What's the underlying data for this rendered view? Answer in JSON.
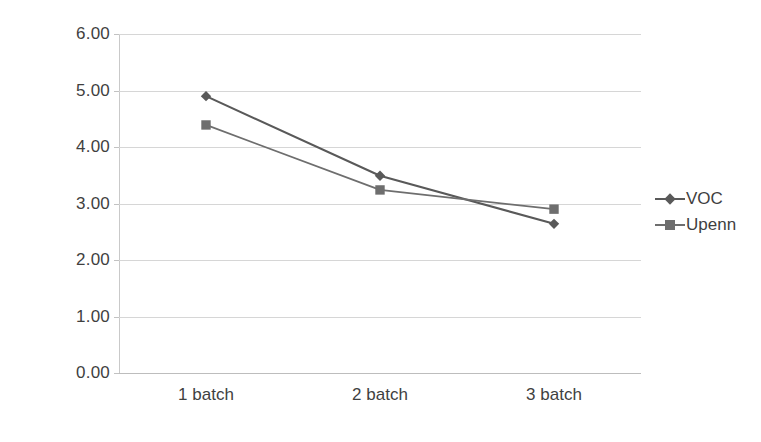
{
  "chart_data": {
    "type": "line",
    "title": "",
    "subtitle": "",
    "xlabel": "",
    "ylabel": "",
    "categories": [
      "1 batch",
      "2 batch",
      "3 batch"
    ],
    "series": [
      {
        "name": "VOC",
        "marker": "diamond",
        "color": "#595959",
        "values": [
          4.9,
          3.49,
          2.64
        ]
      },
      {
        "name": "Upenn",
        "marker": "square",
        "color": "#6e6e6e",
        "values": [
          4.39,
          3.24,
          2.9
        ]
      }
    ],
    "ylim": [
      0.0,
      6.0
    ],
    "ytick_step": 1.0,
    "ytick_labels": [
      "6.00",
      "5.00",
      "4.00",
      "3.00",
      "2.00",
      "1.00",
      "0.00"
    ],
    "ytick_values": [
      6.0,
      5.0,
      4.0,
      3.0,
      2.0,
      1.0,
      0.0
    ],
    "grid": {
      "horizontal": true,
      "vertical": false,
      "color": "#d6d6d6"
    },
    "legend": {
      "position": "right",
      "entries": [
        "VOC",
        "Upenn"
      ]
    }
  }
}
